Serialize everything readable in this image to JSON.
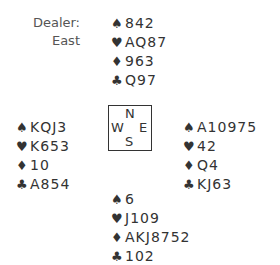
{
  "dealer": {
    "label": "Dealer:",
    "value": "East"
  },
  "suits": {
    "spades": "♠",
    "hearts": "♥",
    "diamonds": "♦",
    "clubs": "♣"
  },
  "hands": {
    "north": {
      "spades": "842",
      "hearts": "AQ87",
      "diamonds": "963",
      "clubs": "Q97"
    },
    "west": {
      "spades": "KQJ3",
      "hearts": "K653",
      "diamonds": "10",
      "clubs": "A854"
    },
    "east": {
      "spades": "A10975",
      "hearts": "42",
      "diamonds": "Q4",
      "clubs": "KJ63"
    },
    "south": {
      "spades": "6",
      "hearts": "J109",
      "diamonds": "AKJ8752",
      "clubs": "102"
    }
  },
  "compass": {
    "n": "N",
    "s": "S",
    "w": "W",
    "e": "E"
  }
}
